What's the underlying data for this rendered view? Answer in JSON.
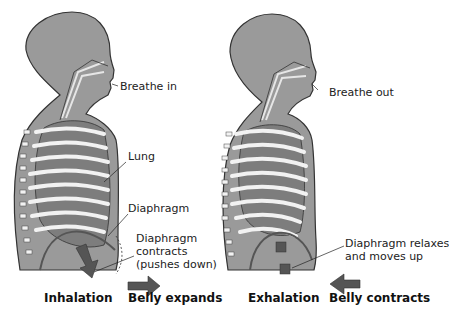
{
  "colors": {
    "body": "#9a9a9a",
    "body_outline": "#333333",
    "lung": "#7d7d7d",
    "rib": "#f2f2f2",
    "arrow": "#555555",
    "text": "#222222"
  },
  "panels": [
    {
      "name": "inhalation",
      "labels": {
        "breathe": "Breathe in",
        "lung": "Lung",
        "diaphragm": "Diaphragm",
        "action_line1": "Diaphragm",
        "action_line2": "contracts",
        "action_line3": "(pushes down)"
      },
      "caption": "Inhalation",
      "belly": "Belly expands",
      "belly_arrow": "right-arrow"
    },
    {
      "name": "exhalation",
      "labels": {
        "breathe": "Breathe out",
        "action_line1": "Diaphragm relaxes",
        "action_line2": "and moves up"
      },
      "caption": "Exhalation",
      "belly": "Belly contracts",
      "belly_arrow": "left-arrow"
    }
  ]
}
